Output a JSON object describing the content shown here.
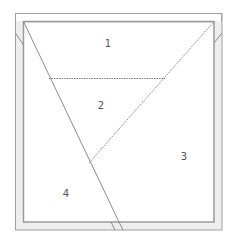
{
  "diagram": {
    "type": "floor-plan-partition",
    "colors": {
      "frame_stroke": "#9a9a9a",
      "band_fill": "#ececec",
      "line_stroke": "#8a8a8a",
      "label": "#555555"
    },
    "regions": [
      {
        "id": "1",
        "label": "1",
        "x": 108,
        "y": 44
      },
      {
        "id": "2",
        "label": "2",
        "x": 101,
        "y": 106
      },
      {
        "id": "3",
        "label": "3",
        "x": 184,
        "y": 157
      },
      {
        "id": "4",
        "label": "4",
        "x": 66,
        "y": 194
      }
    ]
  }
}
